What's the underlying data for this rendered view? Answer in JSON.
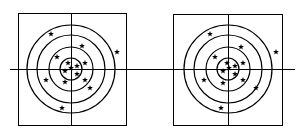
{
  "figure": {
    "line_color": "#000000",
    "background": "#ffffff",
    "star_glyph": "★",
    "panels": [
      {
        "id": "left-target",
        "frame": {
          "x": 18,
          "y": 13,
          "w": 108,
          "h": 112
        },
        "center": {
          "x": 71,
          "y": 69
        },
        "ring_radii": [
          44,
          34,
          22,
          11
        ],
        "axis_h": {
          "x1": 10,
          "x2": 150,
          "y": 69
        },
        "axis_v": {
          "x": 71,
          "y1": 13,
          "y2": 125
        },
        "stars": [
          [
            51,
            34
          ],
          [
            82,
            46
          ],
          [
            117,
            52
          ],
          [
            57,
            57
          ],
          [
            68,
            63
          ],
          [
            77,
            66
          ],
          [
            85,
            63
          ],
          [
            65,
            71
          ],
          [
            71,
            68
          ],
          [
            77,
            74
          ],
          [
            46,
            80
          ],
          [
            65,
            82
          ],
          [
            85,
            80
          ],
          [
            90,
            88
          ],
          [
            62,
            108
          ]
        ]
      },
      {
        "id": "right-target",
        "frame": {
          "x": 173,
          "y": 14,
          "w": 109,
          "h": 111
        },
        "center": {
          "x": 228,
          "y": 69
        },
        "ring_radii": [
          44,
          34,
          22,
          11
        ],
        "axis_h": {
          "x1": 150,
          "x2": 295,
          "y": 69
        },
        "axis_v": {
          "x": 228,
          "y1": 14,
          "y2": 125
        },
        "stars": [
          [
            210,
            34
          ],
          [
            241,
            47
          ],
          [
            276,
            52
          ],
          [
            215,
            57
          ],
          [
            227,
            63
          ],
          [
            235,
            66
          ],
          [
            243,
            63
          ],
          [
            223,
            71
          ],
          [
            229,
            68
          ],
          [
            235,
            74
          ],
          [
            204,
            80
          ],
          [
            223,
            83
          ],
          [
            243,
            80
          ],
          [
            256,
            88
          ],
          [
            221,
            108
          ]
        ]
      }
    ]
  }
}
